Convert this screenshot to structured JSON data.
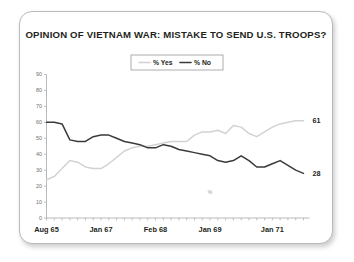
{
  "card": {
    "border_color": "#b9b9b9",
    "background": "#ffffff"
  },
  "chart_data": {
    "type": "line",
    "title": "OPINION OF VIETNAM WAR: MISTAKE TO SEND U.S. TROOPS?",
    "xlabel": "",
    "ylabel": "",
    "ylim": [
      0,
      90
    ],
    "ytick_step": 10,
    "yticks": [
      "0",
      "10",
      "20",
      "30",
      "40",
      "50",
      "60",
      "70",
      "80",
      "90"
    ],
    "xtick_labels": [
      "Aug 65",
      "Jan 67",
      "Feb 68",
      "Jan 69",
      "Jan 71"
    ],
    "xtick_positions": [
      0,
      7,
      14,
      21,
      29
    ],
    "n_points": 34,
    "grid": false,
    "legend_position": "top-center",
    "series": [
      {
        "name": "% Yes",
        "color": "#d2d2d2",
        "width": 1.5,
        "end_label": "61",
        "values": [
          24,
          26,
          31,
          36,
          35,
          32,
          31,
          31,
          34,
          38,
          42,
          44,
          45,
          45,
          46,
          47,
          48,
          48,
          48,
          52,
          54,
          54,
          55,
          53,
          58,
          57,
          53,
          51,
          54,
          57,
          59,
          60,
          61,
          61
        ]
      },
      {
        "name": "% No",
        "color": "#3a3a3a",
        "width": 1.5,
        "end_label": "28",
        "values": [
          60,
          60,
          59,
          49,
          48,
          48,
          51,
          52,
          52,
          50,
          48,
          47,
          46,
          44,
          44,
          46,
          45,
          43,
          42,
          41,
          40,
          39,
          36,
          35,
          36,
          39,
          36,
          32,
          32,
          34,
          36,
          33,
          30,
          28
        ]
      }
    ],
    "annotations": [
      {
        "text": "%",
        "x_index": 21,
        "y_value": 15
      }
    ]
  },
  "legend": {
    "items": [
      {
        "label": "% Yes",
        "color": "#d2d2d2"
      },
      {
        "label": "% No",
        "color": "#3a3a3a"
      }
    ]
  }
}
